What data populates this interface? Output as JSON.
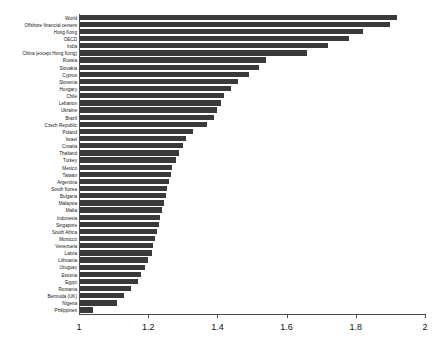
{
  "chart_data": {
    "type": "bar",
    "orientation": "horizontal",
    "title": "",
    "subtitle": "",
    "xlabel": "",
    "ylabel": "",
    "xlim": [
      1,
      2
    ],
    "grid": false,
    "legend": null,
    "bar_color": "#3a3a3a",
    "axis_color": "#4a4a4a",
    "background": "#ffffff",
    "xticks": [
      1,
      1.2,
      1.4,
      1.6,
      1.8,
      2
    ],
    "xtick_labels": [
      "1",
      "1.2",
      "1.4",
      "1.6",
      "1.8",
      "2"
    ],
    "categories": [
      "World",
      "Offshore financial centers",
      "Hong Kong",
      "OECD",
      "India",
      "China (except Hong Kong)",
      "Russia",
      "Slovakia",
      "Cyprus",
      "Slovenia",
      "Hungary",
      "Chile",
      "Lebanon",
      "Ukraine",
      "Brazil",
      "Czech Republic",
      "Poland",
      "Israel",
      "Croatia",
      "Thailand",
      "Turkey",
      "Mexico",
      "Taiwan",
      "Argentina",
      "South Korea",
      "Bulgaria",
      "Malaysia",
      "Malta",
      "Indonesia",
      "Singapore",
      "South Africa",
      "Morocco",
      "Venezuela",
      "Latvia",
      "Lithuania",
      "Uruguay",
      "Estonia",
      "Egypt",
      "Romania",
      "Bermuda (UK)",
      "Nigeria",
      "Philippines"
    ],
    "values": [
      1.92,
      1.9,
      1.82,
      1.78,
      1.72,
      1.66,
      1.54,
      1.52,
      1.49,
      1.46,
      1.44,
      1.42,
      1.41,
      1.4,
      1.39,
      1.37,
      1.33,
      1.31,
      1.3,
      1.29,
      1.28,
      1.27,
      1.265,
      1.26,
      1.255,
      1.25,
      1.245,
      1.24,
      1.235,
      1.23,
      1.225,
      1.22,
      1.215,
      1.21,
      1.2,
      1.19,
      1.18,
      1.17,
      1.15,
      1.13,
      1.11,
      1.04
    ]
  }
}
